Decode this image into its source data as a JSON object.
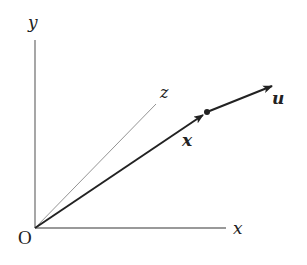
{
  "diagram": {
    "type": "vector-coordinate-diagram",
    "labels": {
      "origin": "O",
      "y_axis": "y",
      "x_axis": "x",
      "z_axis": "z",
      "position_vector": "x",
      "direction_vector": "u"
    },
    "elements": [
      {
        "kind": "axis",
        "name": "y"
      },
      {
        "kind": "axis",
        "name": "x"
      },
      {
        "kind": "axis",
        "name": "z",
        "style": "thin-oblique"
      },
      {
        "kind": "vector",
        "name": "x",
        "from": "O",
        "style": "bold-arrow"
      },
      {
        "kind": "point",
        "name": "tip-of-x"
      },
      {
        "kind": "vector",
        "name": "u",
        "from": "tip-of-x",
        "style": "bold-arrow"
      }
    ],
    "colors": {
      "ink": "#222222",
      "axis": "#777777",
      "background": "#ffffff"
    }
  }
}
